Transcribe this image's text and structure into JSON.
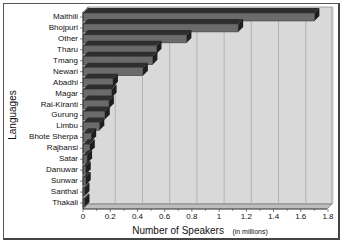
{
  "chart_data": {
    "type": "bar",
    "orientation": "horizontal",
    "style": "3d",
    "title": "",
    "xlabel": "Number of Speakers",
    "xlabel_unit": "(in millions)",
    "ylabel": "Languages",
    "xlim": [
      0,
      1.8
    ],
    "xticks": [
      "0",
      "0.2",
      "0.4",
      "0.6",
      "0.8",
      "1",
      "1.2",
      "1.4",
      "1.6",
      "1.8"
    ],
    "grid": "vertical",
    "legend": "none",
    "categories": [
      "Maithili",
      "Bhojpuri",
      "Other",
      "Tharu",
      "Tmang",
      "Newari",
      "Abadhi",
      "Magar",
      "Rai-Kiranti",
      "Gurung",
      "Limbu",
      "Bhote Sherpa",
      "Rajbansi",
      "Satar",
      "Danuwar",
      "Sunwar",
      "Santhal",
      "Thakali"
    ],
    "values": [
      1.7,
      1.14,
      0.76,
      0.54,
      0.51,
      0.44,
      0.22,
      0.21,
      0.19,
      0.16,
      0.12,
      0.06,
      0.05,
      0.03,
      0.02,
      0.02,
      0.01,
      0.01
    ],
    "colors": {
      "bar_front": "#6b6b6b",
      "bar_top": "#2e2e2e",
      "bar_side": "#1e1e1e",
      "plot_bg": "#d9d9d9",
      "grid": "#9a9a9a",
      "floor": "#bdbdbd"
    }
  }
}
